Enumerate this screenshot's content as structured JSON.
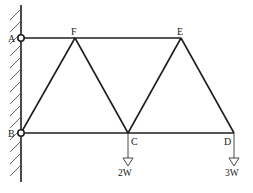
{
  "diagram": {
    "type": "truss",
    "colors": {
      "member": "#1e1e1e",
      "hatch": "#555555",
      "background": "#ffffff"
    },
    "nodes": [
      {
        "id": "A",
        "label": "A",
        "x": 21,
        "y": 38,
        "support": "pin"
      },
      {
        "id": "B",
        "label": "B",
        "x": 21,
        "y": 133,
        "support": "pin"
      },
      {
        "id": "F",
        "label": "F",
        "x": 75,
        "y": 38
      },
      {
        "id": "E",
        "label": "E",
        "x": 181,
        "y": 38
      },
      {
        "id": "C",
        "label": "C",
        "x": 128,
        "y": 133
      },
      {
        "id": "D",
        "label": "D",
        "x": 234,
        "y": 133
      }
    ],
    "members": [
      [
        "A",
        "F"
      ],
      [
        "F",
        "E"
      ],
      [
        "B",
        "C"
      ],
      [
        "C",
        "D"
      ],
      [
        "B",
        "F"
      ],
      [
        "F",
        "C"
      ],
      [
        "C",
        "E"
      ],
      [
        "E",
        "D"
      ]
    ],
    "loads": [
      {
        "node": "C",
        "label": "2W"
      },
      {
        "node": "D",
        "label": "3W"
      }
    ],
    "labels": {
      "A": "A",
      "B": "B",
      "C": "C",
      "D": "D",
      "E": "E",
      "F": "F",
      "load_c": "2W",
      "load_d": "3W"
    }
  }
}
